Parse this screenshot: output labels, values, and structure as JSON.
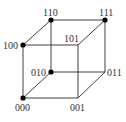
{
  "diagram": {
    "type": "hypercube-3d",
    "colors": {
      "edge": "#2a2a2a",
      "vertex": "#000000",
      "label": "#333333"
    },
    "vertices": [
      {
        "id": "000",
        "label": "000",
        "x": 23,
        "y": 98,
        "dot": true,
        "lx": 15,
        "ly": 111
      },
      {
        "id": "001",
        "label": "001",
        "x": 78,
        "y": 98,
        "dot": false,
        "lx": 70,
        "ly": 111
      },
      {
        "id": "010",
        "label": "010",
        "x": 51,
        "y": 72,
        "dot": true,
        "lx": 31,
        "ly": 76
      },
      {
        "id": "011",
        "label": "011",
        "x": 105,
        "y": 72,
        "dot": false,
        "lx": 107,
        "ly": 76
      },
      {
        "id": "100",
        "label": "100",
        "x": 23,
        "y": 45,
        "dot": true,
        "lx": 3,
        "ly": 49
      },
      {
        "id": "101",
        "label": "101",
        "x": 78,
        "y": 45,
        "dot": false,
        "lx": 64,
        "ly": 42
      },
      {
        "id": "110",
        "label": "110",
        "x": 51,
        "y": 20,
        "dot": true,
        "lx": 43,
        "ly": 16
      },
      {
        "id": "111",
        "label": "111",
        "x": 105,
        "y": 20,
        "dot": true,
        "lx": 99,
        "ly": 16
      }
    ],
    "edges": [
      [
        "000",
        "001"
      ],
      [
        "000",
        "010"
      ],
      [
        "000",
        "100"
      ],
      [
        "001",
        "011"
      ],
      [
        "001",
        "101"
      ],
      [
        "010",
        "011"
      ],
      [
        "010",
        "110"
      ],
      [
        "011",
        "111"
      ],
      [
        "100",
        "101"
      ],
      [
        "100",
        "110"
      ],
      [
        "101",
        "111"
      ],
      [
        "110",
        "111"
      ]
    ]
  }
}
